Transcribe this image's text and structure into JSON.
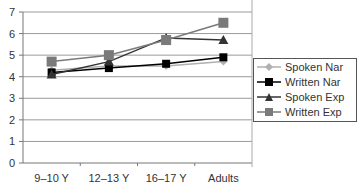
{
  "chart_data": {
    "type": "line",
    "title": "",
    "xlabel": "",
    "ylabel": "",
    "categories": [
      "9–10 Y",
      "12–13 Y",
      "16–17 Y",
      "Adults"
    ],
    "ylim": [
      0,
      7
    ],
    "yticks": [
      0,
      1,
      2,
      3,
      4,
      5,
      6,
      7
    ],
    "grid": true,
    "legend_position": "right",
    "series": [
      {
        "name": "Spoken Nar",
        "marker": "diamond",
        "color": "#b0b0b0",
        "values": [
          4.3,
          4.5,
          4.5,
          4.7
        ]
      },
      {
        "name": "Written Nar",
        "marker": "square",
        "color": "#000000",
        "values": [
          4.2,
          4.4,
          4.6,
          4.9
        ]
      },
      {
        "name": "Spoken Exp",
        "marker": "triangle",
        "color": "#333333",
        "values": [
          4.1,
          4.7,
          5.8,
          5.7
        ]
      },
      {
        "name": "Written Exp",
        "marker": "square",
        "color": "#7a7a7a",
        "values": [
          4.7,
          5.0,
          5.7,
          6.5
        ]
      }
    ]
  }
}
